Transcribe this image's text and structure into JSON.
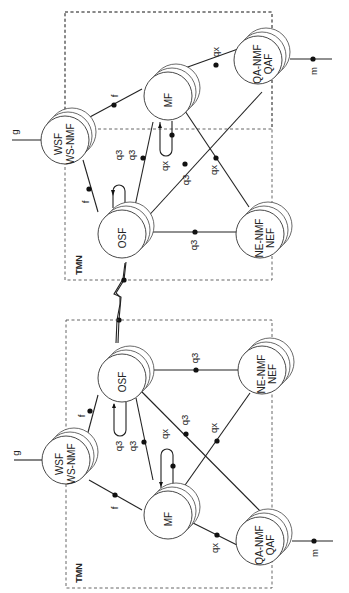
{
  "diagram": {
    "orientation": "rotated 90 degrees counter-clockwise (text reads bottom-to-top)",
    "networks": [
      {
        "id": "top",
        "label": "TMN",
        "nodes": {
          "osf": "OSF",
          "mf": "MF",
          "ws_line1": "WSF",
          "ws_line2": "WS-NMF",
          "qa_line1": "QA-NMF",
          "qa_line2": "QAF",
          "ne_line1": "NE-NMF",
          "ne_line2": "NEF"
        },
        "refs": {
          "osf_ws": "f",
          "mf_ws": "f",
          "osf_loop": "q3",
          "osf_mf": "q3",
          "mf_loop": "qx",
          "osf_qa": "q3",
          "mf_ne": "qx",
          "osf_ne": "q3",
          "mf_qa": "qx",
          "ws_out": "g",
          "qa_out": "m"
        }
      },
      {
        "id": "bottom",
        "label": "TMN",
        "nodes": {
          "osf": "OSF",
          "mf": "MF",
          "ws_line1": "WSF",
          "ws_line2": "WS-NMF",
          "qa_line1": "QA-NMF",
          "qa_line2": "QAF",
          "ne_line1": "NE-NMF",
          "ne_line2": "NEF"
        },
        "refs": {
          "osf_ws": "f",
          "mf_ws": "f",
          "osf_loop": "q3",
          "osf_mf": "q3",
          "mf_loop": "qx",
          "osf_qa": "q3",
          "mf_ne": "qx",
          "osf_ne": "q3",
          "mf_qa": "qx",
          "ws_out": "g",
          "qa_out": "m"
        }
      }
    ],
    "inter_tmn_link": "x (zigzag link between OSFs)"
  }
}
